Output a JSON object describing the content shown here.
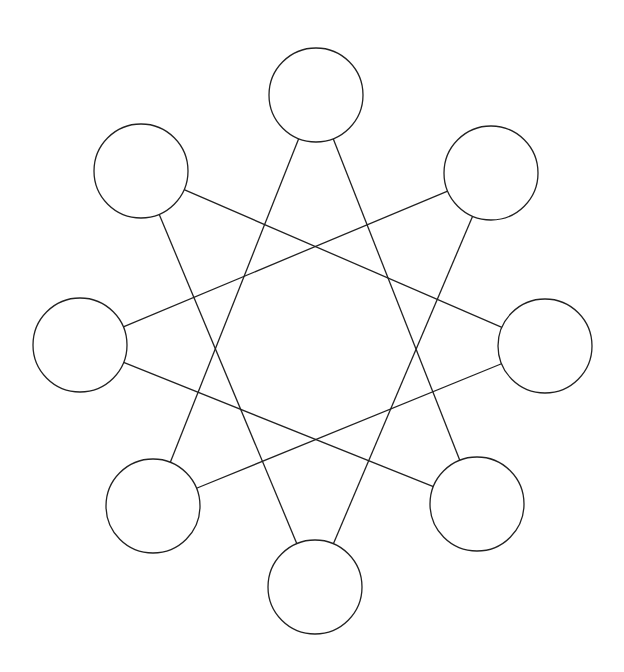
{
  "diagram": {
    "type": "star-polygon-graph",
    "stroke_color": "#222222",
    "fill_color": "#ffffff",
    "node_radius": 47,
    "nodes": [
      {
        "id": "top",
        "cx": 316,
        "cy": 95
      },
      {
        "id": "upper-right",
        "cx": 491,
        "cy": 173
      },
      {
        "id": "right",
        "cx": 545,
        "cy": 346
      },
      {
        "id": "lower-right",
        "cx": 477,
        "cy": 504
      },
      {
        "id": "bottom",
        "cx": 315,
        "cy": 587
      },
      {
        "id": "lower-left",
        "cx": 153,
        "cy": 506
      },
      {
        "id": "left",
        "cx": 80,
        "cy": 345
      },
      {
        "id": "upper-left",
        "cx": 141,
        "cy": 171
      }
    ],
    "edges": [
      [
        "top",
        "lower-right"
      ],
      [
        "top",
        "lower-left"
      ],
      [
        "upper-right",
        "bottom"
      ],
      [
        "upper-right",
        "left"
      ],
      [
        "right",
        "lower-left"
      ],
      [
        "right",
        "upper-left"
      ],
      [
        "lower-right",
        "left"
      ],
      [
        "bottom",
        "upper-left"
      ]
    ]
  }
}
